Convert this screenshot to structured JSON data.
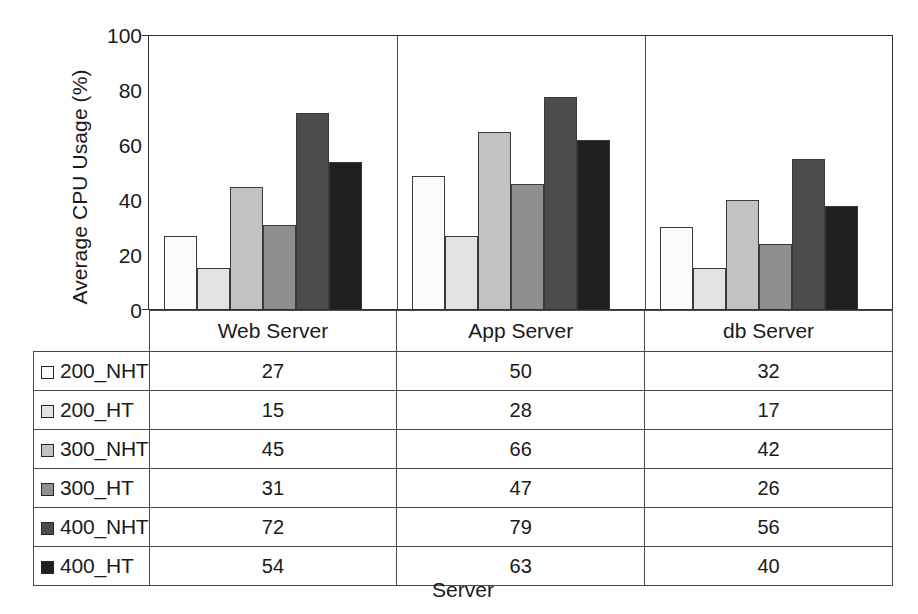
{
  "chart_data": {
    "type": "bar",
    "title": "",
    "xlabel": "Server",
    "ylabel": "Average CPU Usage (%)",
    "categories": [
      "Web Server",
      "App Server",
      "db Server"
    ],
    "ylim": [
      0,
      100
    ],
    "yticks": [
      0,
      20,
      40,
      60,
      80,
      100
    ],
    "grid": false,
    "legend_position": "table-left-column",
    "series": [
      {
        "name": "200_NHT",
        "color": "#fbfbfb",
        "values": [
          27,
          50,
          32
        ]
      },
      {
        "name": "200_HT",
        "color": "#e3e3e3",
        "values": [
          15,
          28,
          17
        ]
      },
      {
        "name": "300_NHT",
        "color": "#c2c2c2",
        "values": [
          45,
          66,
          42
        ]
      },
      {
        "name": "300_HT",
        "color": "#8f8f8f",
        "values": [
          31,
          47,
          26
        ]
      },
      {
        "name": "400_NHT",
        "color": "#4c4c4c",
        "values": [
          72,
          79,
          56
        ]
      },
      {
        "name": "400_HT",
        "color": "#1f1f1f",
        "values": [
          54,
          63,
          40
        ]
      }
    ],
    "plotted_values": [
      {
        "name": "200_NHT",
        "values": [
          27,
          49,
          30
        ]
      },
      {
        "name": "200_HT",
        "values": [
          15,
          27,
          15
        ]
      },
      {
        "name": "300_NHT",
        "values": [
          45,
          65,
          40
        ]
      },
      {
        "name": "300_HT",
        "values": [
          31,
          46,
          24
        ]
      },
      {
        "name": "400_NHT",
        "values": [
          72,
          78,
          55
        ]
      },
      {
        "name": "400_HT",
        "values": [
          54,
          62,
          38
        ]
      }
    ]
  },
  "table": {
    "column_headers": [
      "Web Server",
      "App Server",
      "db Server"
    ],
    "rows": [
      {
        "label": "200_NHT",
        "color": "#fbfbfb",
        "values": [
          "27",
          "50",
          "32"
        ]
      },
      {
        "label": "200_HT",
        "color": "#e3e3e3",
        "values": [
          "15",
          "28",
          "17"
        ]
      },
      {
        "label": "300_NHT",
        "color": "#c2c2c2",
        "values": [
          "45",
          "66",
          "42"
        ]
      },
      {
        "label": "300_HT",
        "color": "#8f8f8f",
        "values": [
          "31",
          "47",
          "26"
        ]
      },
      {
        "label": "400_NHT",
        "color": "#4c4c4c",
        "values": [
          "72",
          "79",
          "56"
        ]
      },
      {
        "label": "400_HT",
        "color": "#1f1f1f",
        "values": [
          "54",
          "63",
          "40"
        ]
      }
    ]
  },
  "axes": {
    "y_title": "Average CPU Usage (%)",
    "x_title": "Server",
    "y_tick_labels": [
      "100",
      "80",
      "60",
      "40",
      "20",
      "0"
    ]
  }
}
